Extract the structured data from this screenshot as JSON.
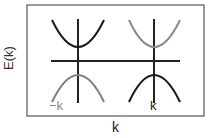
{
  "diagram": {
    "ylabel": "E(k)",
    "xlabel": "k",
    "valleys": [
      {
        "label": "−k",
        "upper_band_color": "#1a1a1a",
        "lower_band_color": "#808080",
        "label_color": "#8a8a8a"
      },
      {
        "label": "k",
        "upper_band_color": "#8a8a8a",
        "lower_band_color": "#1a1a1a",
        "label_color": "#1a1a1a"
      }
    ],
    "colors": {
      "frame": "#555555",
      "axis": "#222222",
      "dark": "#1a1a1a",
      "gray": "#8a8a8a"
    }
  }
}
